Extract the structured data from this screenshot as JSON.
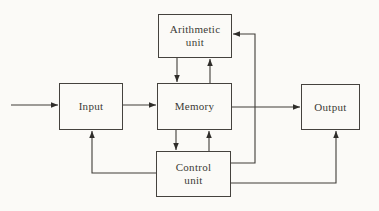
{
  "diagram": {
    "nodes": {
      "arithmetic": {
        "line1": "Arithmetic",
        "line2": "unit"
      },
      "input": {
        "label": "Input"
      },
      "memory": {
        "label": "Memory"
      },
      "output": {
        "label": "Output"
      },
      "control": {
        "line1": "Control",
        "line2": "unit"
      }
    },
    "edges": [
      {
        "from": "external",
        "to": "input"
      },
      {
        "from": "input",
        "to": "memory"
      },
      {
        "from": "memory",
        "to": "output"
      },
      {
        "from": "arithmetic",
        "to": "memory"
      },
      {
        "from": "memory",
        "to": "arithmetic"
      },
      {
        "from": "memory",
        "to": "control"
      },
      {
        "from": "control",
        "to": "memory"
      },
      {
        "from": "control",
        "to": "arithmetic"
      },
      {
        "from": "control",
        "to": "input"
      },
      {
        "from": "control",
        "to": "output"
      }
    ],
    "colors": {
      "line": "#403d39",
      "text": "#3c3a36",
      "paper": "#fbfaf7"
    }
  }
}
